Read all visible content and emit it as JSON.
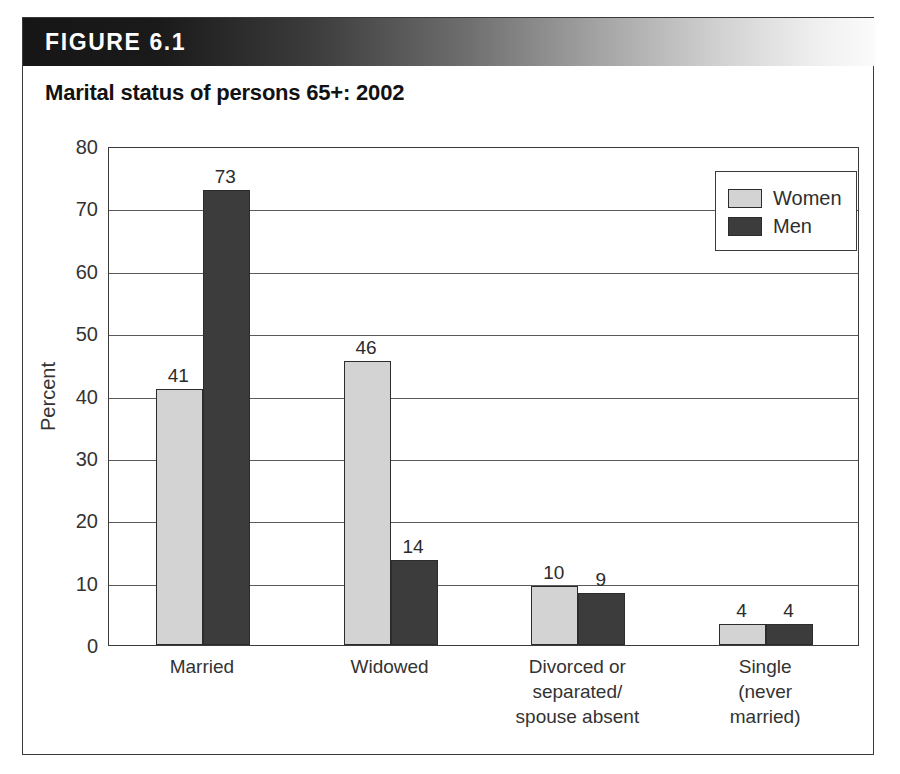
{
  "figure": {
    "header_label": "FIGURE 6.1",
    "title": "Marital status of persons 65+: 2002"
  },
  "chart_data": {
    "type": "bar",
    "title": "Marital status of persons 65+: 2002",
    "xlabel": "",
    "ylabel": "Percent",
    "ylim": [
      0,
      80
    ],
    "ytick_step": 10,
    "yticks": [
      "80",
      "70",
      "60",
      "50",
      "40",
      "30",
      "20",
      "10",
      "0"
    ],
    "ytick_values": [
      80,
      70,
      60,
      50,
      40,
      30,
      20,
      10,
      0
    ],
    "grid": "horizontal",
    "legend_position": "top-right",
    "categories": [
      "Married",
      "Widowed",
      "Divorced or\nseparated/\nspouse absent",
      "Single\n(never\nmarried)"
    ],
    "series": [
      {
        "name": "Women",
        "color": "#d3d3d3",
        "values": [
          41,
          46,
          10,
          4
        ],
        "labels": [
          "41",
          "46",
          "10",
          "4"
        ],
        "plotted": [
          41,
          45.5,
          9.5,
          3.3
        ]
      },
      {
        "name": "Men",
        "color": "#3c3c3c",
        "values": [
          73,
          14,
          9,
          4
        ],
        "labels": [
          "73",
          "14",
          "9",
          "4"
        ],
        "plotted": [
          73,
          13.7,
          8.4,
          3.3
        ]
      }
    ]
  }
}
